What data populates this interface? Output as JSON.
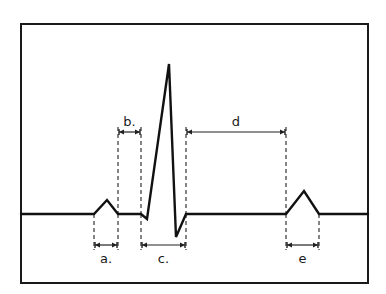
{
  "figure": {
    "frame": {
      "x": 21,
      "y": 24,
      "width": 347,
      "height": 259
    },
    "colors": {
      "ink": "#111111",
      "background": "#ffffff"
    },
    "waveform": {
      "baseline_y": 214,
      "points": [
        [
          21,
          214
        ],
        [
          94,
          214
        ],
        [
          107,
          200
        ],
        [
          118,
          214
        ],
        [
          141,
          214
        ],
        [
          147,
          219
        ],
        [
          169,
          64
        ],
        [
          176,
          237
        ],
        [
          186,
          214
        ],
        [
          286,
          214
        ],
        [
          304,
          191
        ],
        [
          319,
          214
        ],
        [
          368,
          214
        ]
      ],
      "segments": {
        "p_wave": {
          "start_x": 94,
          "peak": [
            107,
            200
          ],
          "end_x": 118
        },
        "qrs_complex": {
          "q": [
            147,
            219
          ],
          "r": [
            169,
            64
          ],
          "s": [
            176,
            237
          ],
          "start_x": 141,
          "end_x": 186
        },
        "t_wave": {
          "start_x": 286,
          "peak": [
            304,
            191
          ],
          "end_x": 319
        }
      }
    },
    "intervals": [
      {
        "id": "a",
        "label": "a.",
        "x1": 94,
        "x2": 118,
        "arrow_y": 245,
        "label_y": 263,
        "guide_top": 214,
        "guide_bottom": 250
      },
      {
        "id": "b",
        "label": "b.",
        "x1": 118,
        "x2": 141,
        "arrow_y": 132,
        "label_y": 126,
        "guide_top": 127,
        "guide_bottom": 214
      },
      {
        "id": "c",
        "label": "c.",
        "x1": 141,
        "x2": 186,
        "arrow_y": 245,
        "label_y": 263,
        "guide_top": 214,
        "guide_bottom": 250
      },
      {
        "id": "d",
        "label": "d",
        "x1": 186,
        "x2": 286,
        "arrow_y": 132,
        "label_y": 126,
        "guide_top": 127,
        "guide_bottom": 214
      },
      {
        "id": "e",
        "label": "e",
        "x1": 286,
        "x2": 319,
        "arrow_y": 245,
        "label_y": 263,
        "guide_top": 214,
        "guide_bottom": 250
      }
    ]
  }
}
